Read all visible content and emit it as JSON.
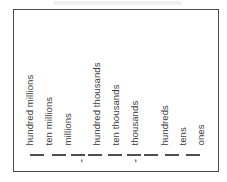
{
  "page": {
    "width": 227,
    "height": 182,
    "background_color": "#ffffff",
    "ink_color": "#3a3a3a",
    "border_color": "#4a4a4a"
  },
  "chart": {
    "title": "",
    "separator": ",",
    "blank_mark": "—",
    "groups": [
      {
        "name": "millions-period",
        "places": [
          {
            "label": "hundred millions",
            "x": 20,
            "blank_x": 16
          },
          {
            "label": "ten millions",
            "x": 39,
            "blank_x": 38
          },
          {
            "label": "millions",
            "x": 58,
            "blank_x": 57
          }
        ],
        "comma_x": 66
      },
      {
        "name": "thousands-period",
        "places": [
          {
            "label": "hundred thousands",
            "x": 87,
            "blank_x": 85
          },
          {
            "label": "ten thousands",
            "x": 106,
            "blank_x": 105
          },
          {
            "label": "thousands",
            "x": 125,
            "blank_x": 124
          }
        ],
        "comma_x": 120
      },
      {
        "name": "ones-period",
        "places": [
          {
            "label": "hundreds",
            "x": 155,
            "blank_x": 139
          },
          {
            "label": "tens",
            "x": 173,
            "blank_x": 159
          },
          {
            "label": "ones",
            "x": 191,
            "blank_x": 179
          }
        ],
        "comma_x": null
      }
    ]
  }
}
